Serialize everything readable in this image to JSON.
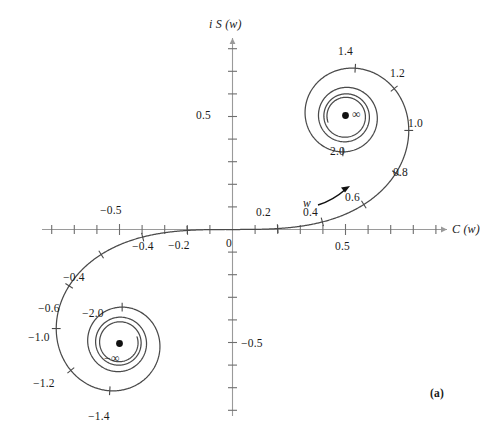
{
  "figure": {
    "panel_label": "(a)",
    "caption_type": "cornu-spiral",
    "background_color": "#ffffff",
    "curve_color": "#4a4a4a",
    "axis_color": "#9a9a9a",
    "text_color": "#1a1a1a"
  },
  "axes": {
    "x": {
      "name": "C (w)",
      "name_italic_part": "w",
      "range": [
        -0.9,
        0.94
      ],
      "tick_step": 0.1,
      "labeled_ticks": [
        {
          "value": -0.5,
          "text": "−0.5",
          "side": "above"
        },
        {
          "value": -0.4,
          "text": "−0.4",
          "side": "below"
        },
        {
          "value": -0.2,
          "text": "−0.2",
          "side": "below"
        },
        {
          "value": 0.0,
          "text": "0",
          "side": "below"
        },
        {
          "value": 0.2,
          "text": "0.2",
          "side": "above"
        },
        {
          "value": 0.5,
          "text": "0.5",
          "side": "below"
        }
      ],
      "arrow": "right"
    },
    "y": {
      "name": "i S (w)",
      "range": [
        -0.88,
        0.88
      ],
      "tick_step": 0.1,
      "labeled_ticks": [
        {
          "value": 0.5,
          "text": "0.5",
          "side": "left"
        },
        {
          "value": -0.5,
          "text": "−0.5",
          "side": "right"
        }
      ],
      "arrow": "up"
    }
  },
  "chart_data": {
    "type": "line",
    "title": "",
    "subtitle": "",
    "xlabel": "C (w)",
    "ylabel": "i S (w)",
    "xlim": [
      -0.9,
      0.94
    ],
    "ylim": [
      -0.88,
      0.88
    ],
    "grid": false,
    "legend": null,
    "series": [
      {
        "name": "Cornu spiral (Fresnel integrals)",
        "parameter": "w",
        "parameter_range": [
          -3.6,
          3.6
        ],
        "formula_x": "C(w) = ∫0^w cos(πt²/2) dt",
        "formula_y": "S(w) = ∫0^w sin(πt²/2) dt",
        "points": [
          {
            "w": 0.0,
            "C": 0.0,
            "S": 0.0
          },
          {
            "w": 0.2,
            "C": 0.1999,
            "S": 0.0042
          },
          {
            "w": 0.4,
            "C": 0.3975,
            "S": 0.0334
          },
          {
            "w": 0.6,
            "C": 0.5811,
            "S": 0.1105
          },
          {
            "w": 0.8,
            "C": 0.7228,
            "S": 0.2493
          },
          {
            "w": 1.0,
            "C": 0.7799,
            "S": 0.4383
          },
          {
            "w": 1.2,
            "C": 0.7154,
            "S": 0.6234
          },
          {
            "w": 1.4,
            "C": 0.5431,
            "S": 0.7135
          },
          {
            "w": 1.6,
            "C": 0.3655,
            "S": 0.6389
          },
          {
            "w": 1.8,
            "C": 0.3336,
            "S": 0.4509
          },
          {
            "w": 2.0,
            "C": 0.4883,
            "S": 0.3434
          },
          {
            "w": 2.2,
            "C": 0.6363,
            "S": 0.4557
          },
          {
            "w": 2.4,
            "C": 0.555,
            "S": 0.6197
          },
          {
            "w": 2.6,
            "C": 0.3889,
            "S": 0.55
          },
          {
            "w": 2.8,
            "C": 0.4674,
            "S": 0.3915
          },
          {
            "w": 3.0,
            "C": 0.6058,
            "S": 0.4963
          },
          {
            "w": 3.2,
            "C": 0.4663,
            "S": 0.5933
          },
          {
            "w": 3.4,
            "C": 0.4383,
            "S": 0.4296
          },
          {
            "w": 3.6,
            "C": 0.588,
            "S": 0.4923
          }
        ],
        "limit_point_positive": {
          "C": 0.5,
          "S": 0.5,
          "label": "∞"
        },
        "limit_point_negative": {
          "C": -0.5,
          "S": -0.5,
          "label": "−∞"
        }
      }
    ],
    "parameter_ticks_positive": [
      "0.2",
      "0.4",
      "0.6",
      "0.8",
      "1.0",
      "1.2",
      "1.4",
      "2.0"
    ],
    "parameter_ticks_negative": [
      "−0.2",
      "−0.4",
      "−0.6",
      "−0.8",
      "−1.0",
      "−1.2",
      "−1.4",
      "−2.0"
    ]
  },
  "annotations": {
    "direction_arrow": {
      "label": "w",
      "description": "arrow indicating increasing w along the curve"
    },
    "upper_spiral": {
      "center_label": "∞",
      "tick_labels": [
        {
          "text": "1.4",
          "w": 1.4
        },
        {
          "text": "1.2",
          "w": 1.2
        },
        {
          "text": "1.0",
          "w": 1.0
        },
        {
          "text": "0.8",
          "w": 0.8
        },
        {
          "text": "0.6",
          "w": 0.6
        },
        {
          "text": "0.4",
          "w": 0.4
        },
        {
          "text": "0.2",
          "w": 0.2
        },
        {
          "text": "2.0",
          "w": 2.0
        }
      ]
    },
    "lower_spiral": {
      "center_label": "−∞",
      "tick_labels": [
        {
          "text": "−1.4",
          "w": -1.4
        },
        {
          "text": "−1.2",
          "w": -1.2
        },
        {
          "text": "−1.0",
          "w": -1.0
        },
        {
          "text": "−0.8",
          "w": -0.8
        },
        {
          "text": "−0.6",
          "w": -0.6
        },
        {
          "text": "−0.4",
          "w": -0.4
        },
        {
          "text": "−0.2",
          "w": -0.2
        },
        {
          "text": "−2.0",
          "w": -2.0
        }
      ]
    }
  }
}
